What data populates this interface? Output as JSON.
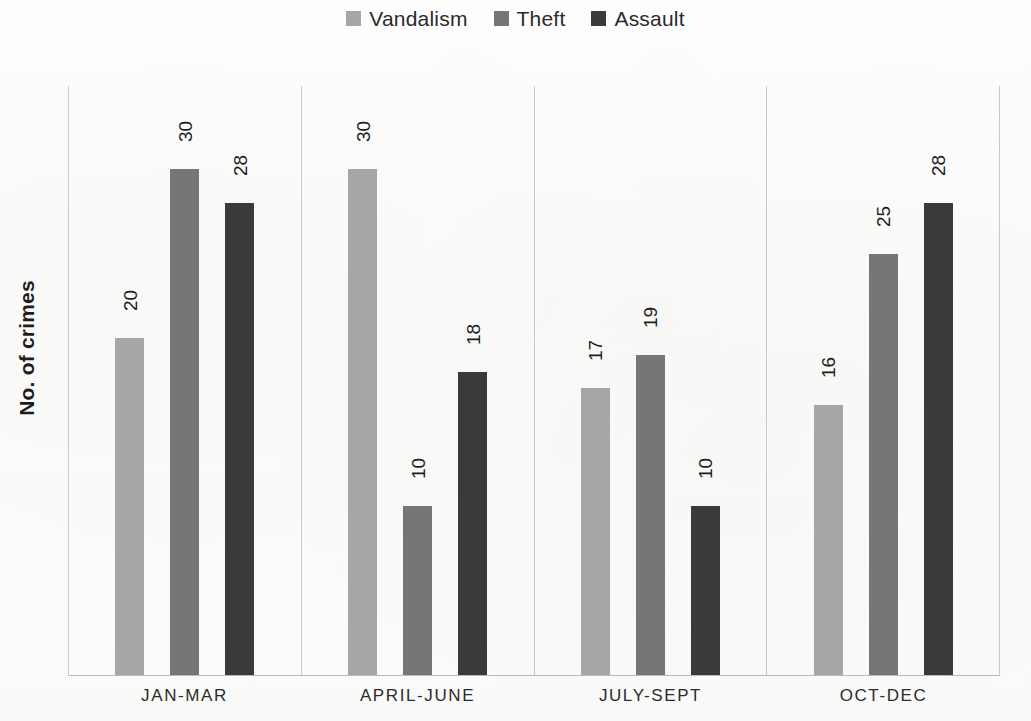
{
  "chart_data": {
    "type": "bar",
    "title": "",
    "subtitle": "",
    "xlabel": "",
    "ylabel": "No. of crimes",
    "categories": [
      "JAN-MAR",
      "APRIL-JUNE",
      "JULY-SEPT",
      "OCT-DEC"
    ],
    "series": [
      {
        "name": "Vandalism",
        "color": "#a6a6a6",
        "values": [
          20,
          30,
          17,
          16
        ]
      },
      {
        "name": "Theft",
        "color": "#767676",
        "values": [
          30,
          10,
          19,
          25
        ]
      },
      {
        "name": "Assault",
        "color": "#3a3a3a",
        "values": [
          28,
          18,
          10,
          28
        ]
      }
    ],
    "ylim": [
      0,
      35
    ],
    "grid": false,
    "y_axis_ticks_visible": false,
    "data_labels_shown": true,
    "data_labels_rotation_deg": -90,
    "legend_position": "top-center",
    "group_separators": true,
    "plot_background": "#ffffff"
  },
  "legend": {
    "items": [
      {
        "label": "Vandalism",
        "color": "#a6a6a6"
      },
      {
        "label": "Theft",
        "color": "#767676"
      },
      {
        "label": "Assault",
        "color": "#3a3a3a"
      }
    ]
  },
  "axis": {
    "y_title": "No. of crimes"
  },
  "groups": [
    {
      "category": "JAN-MAR",
      "bars": [
        {
          "series": "Vandalism",
          "value": 20,
          "label": "20",
          "color": "#a6a6a6"
        },
        {
          "series": "Theft",
          "value": 30,
          "label": "30",
          "color": "#767676"
        },
        {
          "series": "Assault",
          "value": 28,
          "label": "28",
          "color": "#3a3a3a"
        }
      ]
    },
    {
      "category": "APRIL-JUNE",
      "bars": [
        {
          "series": "Vandalism",
          "value": 30,
          "label": "30",
          "color": "#a6a6a6"
        },
        {
          "series": "Theft",
          "value": 10,
          "label": "10",
          "color": "#767676"
        },
        {
          "series": "Assault",
          "value": 18,
          "label": "18",
          "color": "#3a3a3a"
        }
      ]
    },
    {
      "category": "JULY-SEPT",
      "bars": [
        {
          "series": "Vandalism",
          "value": 17,
          "label": "17",
          "color": "#a6a6a6"
        },
        {
          "series": "Theft",
          "value": 19,
          "label": "19",
          "color": "#767676"
        },
        {
          "series": "Assault",
          "value": 10,
          "label": "10",
          "color": "#3a3a3a"
        }
      ]
    },
    {
      "category": "OCT-DEC",
      "bars": [
        {
          "series": "Vandalism",
          "value": 16,
          "label": "16",
          "color": "#a6a6a6"
        },
        {
          "series": "Theft",
          "value": 25,
          "label": "25",
          "color": "#767676"
        },
        {
          "series": "Assault",
          "value": 28,
          "label": "28",
          "color": "#3a3a3a"
        }
      ]
    }
  ]
}
